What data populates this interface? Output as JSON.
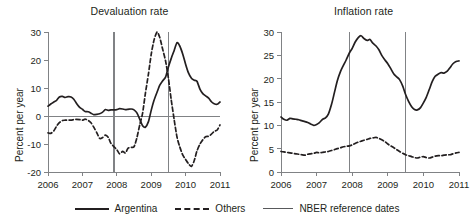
{
  "figure": {
    "background": "#ffffff",
    "ink": "#231f20",
    "rule_color": "#808285"
  },
  "legend": {
    "position": "bottom-center",
    "items": [
      {
        "label": "Argentina",
        "style": "solid",
        "width": 2,
        "color": "#231f20",
        "icon": "solid-line-icon"
      },
      {
        "label": "Others",
        "style": "dashed",
        "width": 2,
        "color": "#231f20",
        "icon": "dashed-line-icon"
      },
      {
        "label": "NBER reference dates",
        "style": "thin-solid",
        "width": 1,
        "color": "#58595b",
        "icon": "thin-line-icon"
      }
    ]
  },
  "chart_data": [
    {
      "type": "line",
      "title": "Devaluation rate",
      "xlabel": "",
      "ylabel": "Percent per year",
      "xlim": [
        2006,
        2011
      ],
      "ylim": [
        -20,
        30
      ],
      "yticks": [
        -20,
        -10,
        0,
        10,
        20,
        30
      ],
      "ytick_labels": [
        "-20",
        "-10",
        "0",
        "10",
        "20",
        "30"
      ],
      "xticks": [
        2006,
        2007,
        2008,
        2009,
        2010,
        2011
      ],
      "xtick_labels": [
        "2006",
        "2007",
        "2008",
        "2009",
        "2010",
        "2011"
      ],
      "grid": false,
      "zero_line": 0,
      "reference_lines": {
        "name": "NBER reference dates",
        "x": [
          2007.92,
          2009.5
        ]
      },
      "series": [
        {
          "name": "Argentina",
          "style": "solid",
          "x": [
            2006.0,
            2006.08,
            2006.17,
            2006.25,
            2006.33,
            2006.42,
            2006.5,
            2006.58,
            2006.67,
            2006.75,
            2006.83,
            2006.92,
            2007.0,
            2007.08,
            2007.17,
            2007.25,
            2007.33,
            2007.42,
            2007.5,
            2007.58,
            2007.67,
            2007.75,
            2007.83,
            2007.92,
            2008.0,
            2008.08,
            2008.17,
            2008.25,
            2008.33,
            2008.42,
            2008.5,
            2008.58,
            2008.67,
            2008.75,
            2008.83,
            2008.92,
            2009.0,
            2009.08,
            2009.17,
            2009.25,
            2009.33,
            2009.42,
            2009.5,
            2009.58,
            2009.67,
            2009.75,
            2009.83,
            2009.92,
            2010.0,
            2010.08,
            2010.17,
            2010.25,
            2010.33,
            2010.42,
            2010.5,
            2010.58,
            2010.67,
            2010.75,
            2010.83,
            2010.92,
            2011.0
          ],
          "y": [
            3.5,
            4.3,
            5.0,
            5.6,
            6.8,
            7.0,
            6.6,
            6.9,
            6.8,
            6.0,
            4.5,
            3.1,
            2.4,
            1.6,
            1.5,
            1.0,
            0.5,
            0.6,
            0.8,
            1.3,
            2.3,
            2.0,
            2.2,
            2.2,
            2.3,
            2.6,
            2.5,
            2.3,
            2.4,
            2.5,
            2.2,
            1.2,
            -1.2,
            -3.5,
            -4.0,
            -2.0,
            2.0,
            5.5,
            8.5,
            11.0,
            12.5,
            14.0,
            17.5,
            20.5,
            23.5,
            26.2,
            25.0,
            22.0,
            18.5,
            15.5,
            13.5,
            12.8,
            12.4,
            9.5,
            8.0,
            7.2,
            6.4,
            5.1,
            4.4,
            4.2,
            5.0
          ]
        },
        {
          "name": "Others",
          "style": "dashed",
          "x": [
            2006.0,
            2006.08,
            2006.17,
            2006.25,
            2006.33,
            2006.42,
            2006.5,
            2006.58,
            2006.67,
            2006.75,
            2006.83,
            2006.92,
            2007.0,
            2007.08,
            2007.17,
            2007.25,
            2007.33,
            2007.42,
            2007.5,
            2007.58,
            2007.67,
            2007.75,
            2007.83,
            2007.92,
            2008.0,
            2008.08,
            2008.17,
            2008.25,
            2008.33,
            2008.42,
            2008.5,
            2008.58,
            2008.67,
            2008.75,
            2008.83,
            2008.92,
            2009.0,
            2009.08,
            2009.17,
            2009.25,
            2009.33,
            2009.42,
            2009.5,
            2009.58,
            2009.67,
            2009.75,
            2009.83,
            2009.92,
            2010.0,
            2010.08,
            2010.17,
            2010.25,
            2010.33,
            2010.42,
            2010.5,
            2010.58,
            2010.67,
            2010.75,
            2010.83,
            2010.92,
            2011.0
          ],
          "y": [
            -6.0,
            -6.2,
            -5.3,
            -3.6,
            -2.4,
            -1.6,
            -1.5,
            -1.4,
            -1.5,
            -1.3,
            -1.2,
            -1.3,
            -1.5,
            -1.1,
            -1.6,
            -2.4,
            -4.0,
            -6.0,
            -8.0,
            -7.8,
            -6.8,
            -7.6,
            -9.8,
            -11.0,
            -12.0,
            -13.5,
            -12.6,
            -13.2,
            -11.5,
            -11.2,
            -11.0,
            -8.0,
            -3.0,
            1.0,
            8.0,
            15.0,
            22.0,
            27.0,
            30.0,
            28.0,
            24.0,
            19.5,
            13.5,
            6.0,
            -1.5,
            -7.5,
            -11.0,
            -14.0,
            -15.5,
            -17.0,
            -18.0,
            -16.0,
            -12.5,
            -10.0,
            -8.5,
            -7.4,
            -7.2,
            -6.5,
            -5.5,
            -5.0,
            -3.2
          ]
        }
      ]
    },
    {
      "type": "line",
      "title": "Inflation rate",
      "xlabel": "",
      "ylabel": "Percent per year",
      "xlim": [
        2006,
        2011
      ],
      "ylim": [
        0,
        30
      ],
      "yticks": [
        0,
        5,
        10,
        15,
        20,
        25,
        30
      ],
      "ytick_labels": [
        "0",
        "5",
        "10",
        "15",
        "20",
        "25",
        "30"
      ],
      "xticks": [
        2006,
        2007,
        2008,
        2009,
        2010,
        2011
      ],
      "xtick_labels": [
        "2006",
        "2007",
        "2008",
        "2009",
        "2010",
        "2011"
      ],
      "grid": false,
      "reference_lines": {
        "name": "NBER reference dates",
        "x": [
          2007.92,
          2009.5
        ]
      },
      "series": [
        {
          "name": "Argentina",
          "style": "solid",
          "x": [
            2006.0,
            2006.08,
            2006.17,
            2006.25,
            2006.33,
            2006.42,
            2006.5,
            2006.58,
            2006.67,
            2006.75,
            2006.83,
            2006.92,
            2007.0,
            2007.08,
            2007.17,
            2007.25,
            2007.33,
            2007.42,
            2007.5,
            2007.58,
            2007.67,
            2007.75,
            2007.83,
            2007.92,
            2008.0,
            2008.08,
            2008.17,
            2008.25,
            2008.33,
            2008.42,
            2008.5,
            2008.58,
            2008.67,
            2008.75,
            2008.83,
            2008.92,
            2009.0,
            2009.08,
            2009.17,
            2009.25,
            2009.33,
            2009.42,
            2009.5,
            2009.58,
            2009.67,
            2009.75,
            2009.83,
            2009.92,
            2010.0,
            2010.08,
            2010.17,
            2010.25,
            2010.33,
            2010.42,
            2010.5,
            2010.58,
            2010.67,
            2010.75,
            2010.83,
            2010.92,
            2011.0
          ],
          "y": [
            11.8,
            11.3,
            11.1,
            11.5,
            11.4,
            11.3,
            11.2,
            11.0,
            10.8,
            10.6,
            10.3,
            10.0,
            10.2,
            10.6,
            11.3,
            11.6,
            12.4,
            14.5,
            17.0,
            19.5,
            21.5,
            22.8,
            24.0,
            25.5,
            26.5,
            27.8,
            28.8,
            29.2,
            28.6,
            28.2,
            28.4,
            27.6,
            27.0,
            26.2,
            25.0,
            24.0,
            23.2,
            22.2,
            21.0,
            20.4,
            19.8,
            18.4,
            16.6,
            15.2,
            14.0,
            13.4,
            13.3,
            13.8,
            14.8,
            16.0,
            17.8,
            19.4,
            20.5,
            21.0,
            21.3,
            21.2,
            21.6,
            22.4,
            23.2,
            23.7,
            23.8
          ]
        },
        {
          "name": "Others",
          "style": "dashed",
          "x": [
            2006.0,
            2006.08,
            2006.17,
            2006.25,
            2006.33,
            2006.42,
            2006.5,
            2006.58,
            2006.67,
            2006.75,
            2006.83,
            2006.92,
            2007.0,
            2007.08,
            2007.17,
            2007.25,
            2007.33,
            2007.42,
            2007.5,
            2007.58,
            2007.67,
            2007.75,
            2007.83,
            2007.92,
            2008.0,
            2008.08,
            2008.17,
            2008.25,
            2008.33,
            2008.42,
            2008.5,
            2008.58,
            2008.67,
            2008.75,
            2008.83,
            2008.92,
            2009.0,
            2009.08,
            2009.17,
            2009.25,
            2009.33,
            2009.42,
            2009.5,
            2009.58,
            2009.67,
            2009.75,
            2009.83,
            2009.92,
            2010.0,
            2010.08,
            2010.17,
            2010.25,
            2010.33,
            2010.42,
            2010.5,
            2010.58,
            2010.67,
            2010.75,
            2010.83,
            2010.92,
            2011.0
          ],
          "y": [
            4.4,
            4.3,
            4.2,
            4.1,
            4.0,
            3.9,
            3.8,
            3.7,
            3.6,
            3.8,
            3.9,
            4.0,
            4.2,
            4.1,
            4.2,
            4.3,
            4.4,
            4.6,
            4.8,
            5.0,
            5.2,
            5.4,
            5.5,
            5.6,
            5.8,
            6.1,
            6.4,
            6.6,
            6.8,
            7.0,
            7.2,
            7.3,
            7.4,
            7.2,
            6.9,
            6.5,
            6.0,
            5.6,
            5.2,
            4.8,
            4.4,
            4.0,
            3.7,
            3.5,
            3.3,
            3.1,
            3.0,
            3.2,
            3.3,
            3.1,
            3.0,
            3.2,
            3.4,
            3.5,
            3.5,
            3.6,
            3.7,
            3.7,
            3.9,
            4.1,
            4.2
          ]
        }
      ]
    }
  ]
}
